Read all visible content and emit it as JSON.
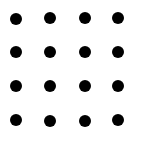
{
  "diagram": {
    "type": "dot-grid",
    "rows": 4,
    "cols": 4,
    "dot_color": "#000000",
    "background": "#ffffff",
    "dot_diameter": 12,
    "dots": [
      {
        "row": 0,
        "col": 0,
        "x": 16,
        "y": 19
      },
      {
        "row": 0,
        "col": 1,
        "x": 50,
        "y": 18
      },
      {
        "row": 0,
        "col": 2,
        "x": 85,
        "y": 18
      },
      {
        "row": 0,
        "col": 3,
        "x": 118,
        "y": 18
      },
      {
        "row": 1,
        "col": 0,
        "x": 16,
        "y": 52
      },
      {
        "row": 1,
        "col": 1,
        "x": 50,
        "y": 52
      },
      {
        "row": 1,
        "col": 2,
        "x": 85,
        "y": 52
      },
      {
        "row": 1,
        "col": 3,
        "x": 118,
        "y": 52
      },
      {
        "row": 2,
        "col": 0,
        "x": 16,
        "y": 86
      },
      {
        "row": 2,
        "col": 1,
        "x": 50,
        "y": 86
      },
      {
        "row": 2,
        "col": 2,
        "x": 85,
        "y": 86
      },
      {
        "row": 2,
        "col": 3,
        "x": 118,
        "y": 86
      },
      {
        "row": 3,
        "col": 0,
        "x": 16,
        "y": 120
      },
      {
        "row": 3,
        "col": 1,
        "x": 50,
        "y": 121
      },
      {
        "row": 3,
        "col": 2,
        "x": 85,
        "y": 121
      },
      {
        "row": 3,
        "col": 3,
        "x": 118,
        "y": 120
      }
    ]
  }
}
